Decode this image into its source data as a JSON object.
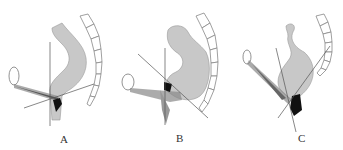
{
  "figure": {
    "panels": [
      {
        "id": "A",
        "label": "A"
      },
      {
        "id": "B",
        "label": "B"
      },
      {
        "id": "C",
        "label": "C"
      }
    ],
    "colors": {
      "rectum_fill": "#c8c8c8",
      "outline": "#888888",
      "dark_region": "#111111",
      "line": "#555555"
    }
  }
}
